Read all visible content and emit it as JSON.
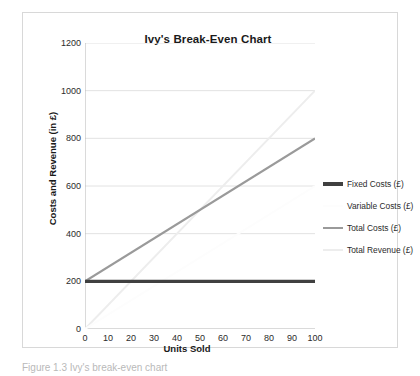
{
  "figure": {
    "caption": "Figure 1.3 Ivy's break-even chart"
  },
  "legend": {
    "position": "right",
    "items": [
      {
        "label": "Fixed Costs (£)",
        "color": "#404040",
        "width": 3.2
      },
      {
        "label": "Variable Costs (£)",
        "color": "#fdfdfd",
        "width": 2.0
      },
      {
        "label": "Total Costs (£)",
        "color": "#9a9a9a",
        "width": 2.2
      },
      {
        "label": "Total Revenue (£)",
        "color": "#ededed",
        "width": 2.0
      }
    ]
  },
  "chart_data": {
    "type": "line",
    "title": "Ivy's Break-Even Chart",
    "xlabel": "Units Sold",
    "ylabel": "Costs and Revenue (in £)",
    "xlim": [
      0,
      100
    ],
    "ylim": [
      0,
      1200
    ],
    "xticks": [
      0,
      10,
      20,
      30,
      40,
      50,
      60,
      70,
      80,
      90,
      100
    ],
    "yticks": [
      0,
      200,
      400,
      600,
      800,
      1000,
      1200
    ],
    "grid": "horizontal",
    "x": [
      0,
      100
    ],
    "series": [
      {
        "name": "Fixed Costs (£)",
        "values": [
          200,
          200
        ],
        "color": "#404040",
        "width": 3.2
      },
      {
        "name": "Variable Costs (£)",
        "values": [
          0,
          600
        ],
        "color": "#fdfdfd",
        "width": 2.0
      },
      {
        "name": "Total Costs (£)",
        "values": [
          200,
          800
        ],
        "color": "#9a9a9a",
        "width": 2.2
      },
      {
        "name": "Total Revenue (£)",
        "values": [
          0,
          1000
        ],
        "color": "#ededed",
        "width": 2.0
      }
    ],
    "break_even": {
      "units": 50,
      "value": 500
    }
  }
}
